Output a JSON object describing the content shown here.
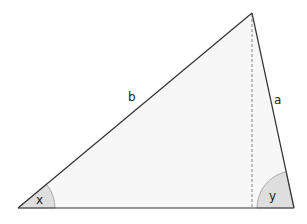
{
  "diagram": {
    "type": "triangle",
    "vertices": {
      "left": [
        18,
        208
      ],
      "apex": [
        252,
        13
      ],
      "right": [
        294,
        208
      ]
    },
    "sides": [
      {
        "name": "b",
        "label": "b",
        "from": "left",
        "to": "apex"
      },
      {
        "name": "a",
        "label": "a",
        "from": "apex",
        "to": "right"
      },
      {
        "name": "base",
        "label": "",
        "from": "left",
        "to": "right"
      }
    ],
    "altitude": {
      "style": "dashed",
      "from": "apex",
      "to_x": 252
    },
    "angles": [
      {
        "name": "x",
        "label": "x",
        "vertex": "left"
      },
      {
        "name": "y",
        "label": "y",
        "vertex": "right"
      }
    ],
    "colors": {
      "fill": "#f7f7f7",
      "stroke": "#333333",
      "angle_fill": "#dedede",
      "angle_stroke": "#9a9a9a",
      "altitude": "#888888"
    }
  }
}
